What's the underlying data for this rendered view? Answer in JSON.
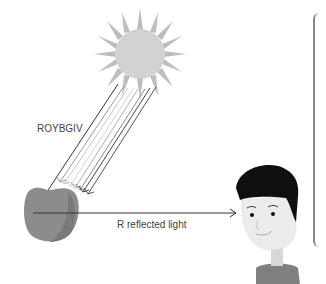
{
  "diagram": {
    "incident_label": "ROYBGIV",
    "reflected_label": "R reflected light",
    "elements": {
      "light_source": "sun",
      "object": "apple",
      "observer": "person"
    },
    "colors": {
      "sun_fill": "#cfcfcf",
      "sun_rays": "#b8b8b8",
      "apple_fill": "#8c8c8c",
      "apple_shade": "#7a7a7a",
      "ray_dark": "#333333",
      "ray_light": "#b0b0b0",
      "hair": "#0f0f0f",
      "skin": "#ececec",
      "shirt": "#7f7f7f",
      "line": "#333333"
    }
  }
}
